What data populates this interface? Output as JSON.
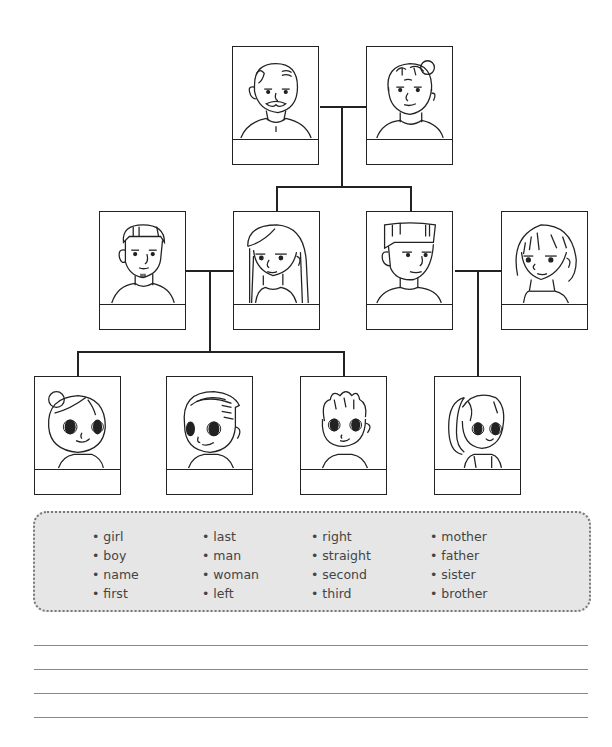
{
  "family_tree": {
    "generation_1": [
      {
        "id": "grandfather",
        "label": ""
      },
      {
        "id": "grandmother",
        "label": ""
      }
    ],
    "generation_2": [
      {
        "id": "man-short-hair-goatee",
        "label": ""
      },
      {
        "id": "woman-long-hair",
        "label": ""
      },
      {
        "id": "man-flat-top",
        "label": ""
      },
      {
        "id": "woman-bob",
        "label": ""
      }
    ],
    "generation_3": [
      {
        "id": "girl-bun",
        "label": ""
      },
      {
        "id": "boy-swept-hair",
        "label": ""
      },
      {
        "id": "boy-spiky-hair",
        "label": ""
      },
      {
        "id": "girl-ponytail",
        "label": ""
      }
    ]
  },
  "word_bank": {
    "columns": [
      [
        "girl",
        "boy",
        "name",
        "first"
      ],
      [
        "last",
        "man",
        "woman",
        "left"
      ],
      [
        "right",
        "straight",
        "second",
        "third"
      ],
      [
        "mother",
        "father",
        "sister",
        "brother"
      ]
    ]
  },
  "writing_lines": {
    "count": 4
  }
}
